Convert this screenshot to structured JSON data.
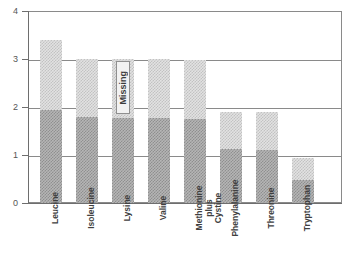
{
  "chart_data": {
    "type": "bar",
    "title": "",
    "subtitle": "",
    "xlabel": "",
    "ylabel": "",
    "ylim": [
      0,
      4
    ],
    "yticks": [
      0,
      1,
      2,
      3,
      4
    ],
    "ytick_labels": [
      "0",
      "1",
      "2",
      "3",
      "4"
    ],
    "grid": true,
    "grid_axis": "y",
    "legend": null,
    "stacked": true,
    "categories": [
      "Leucine",
      "Isoleucine",
      "Lysine",
      "Valine",
      "Methionine plus Cystine",
      "Phenylalanine",
      "Threonine",
      "Tryptophan"
    ],
    "series": [
      {
        "name": "lower-segment",
        "shade": "dark",
        "values": [
          1.93,
          1.8,
          1.78,
          1.78,
          1.75,
          1.12,
          1.1,
          0.48
        ]
      },
      {
        "name": "upper-segment",
        "shade": "light",
        "values": [
          1.47,
          1.2,
          1.22,
          1.22,
          1.22,
          0.78,
          0.8,
          0.45
        ]
      }
    ],
    "totals": [
      3.4,
      3.0,
      3.0,
      3.0,
      2.97,
      1.9,
      1.9,
      0.93
    ],
    "annotations": [
      {
        "text": "Missing",
        "category": "Lysine",
        "orientation": "vertical",
        "value_top": 2.95,
        "value_bottom": 1.85
      }
    ],
    "colors": {
      "dark_fill": "#a0a0a0",
      "light_fill": "#d8d8d8",
      "axis": "#6e6e6e",
      "grid": "#8a8a8a",
      "text": "#3f3f3f",
      "background": "#ffffff"
    }
  }
}
